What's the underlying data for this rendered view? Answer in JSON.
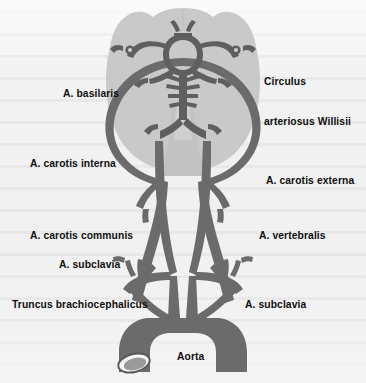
{
  "figure": {
    "colors": {
      "background": "#f2f2f2",
      "brain_fill": "#c9c9c9",
      "brainstem_fill": "#bdbdbd",
      "artery_fill": "#6b6b6b",
      "artery_dark": "#5f5f5f",
      "lumen_fill": "#f7f7f4",
      "label_text": "#0f0f0f"
    },
    "labels": [
      {
        "id": "circulus-arteriosus-willisii",
        "text": "Circulus\narteriosus Willisii",
        "line1": "Circulus",
        "line2": "arteriosus Willisii",
        "x": 264,
        "y": 49,
        "side": "right"
      },
      {
        "id": "a-basilaris",
        "text": "A. basilaris",
        "x": 63,
        "y": 87,
        "side": "left"
      },
      {
        "id": "a-carotis-interna",
        "text": "A. carotis interna",
        "x": 30,
        "y": 157,
        "side": "left"
      },
      {
        "id": "a-carotis-externa",
        "text": "A. carotis externa",
        "x": 266,
        "y": 174,
        "side": "right"
      },
      {
        "id": "a-carotis-communis",
        "text": "A. carotis communis",
        "x": 30,
        "y": 229,
        "side": "left"
      },
      {
        "id": "a-vertebralis",
        "text": "A. vertebralis",
        "x": 259,
        "y": 229,
        "side": "right"
      },
      {
        "id": "a-subclavia-left",
        "text": "A. subclavia",
        "x": 59,
        "y": 258,
        "side": "left"
      },
      {
        "id": "truncus-brachiocephalicus",
        "text": "Truncus brachiocephalicus",
        "x": 12,
        "y": 298,
        "side": "left"
      },
      {
        "id": "a-subclavia-right",
        "text": "A. subclavia",
        "x": 245,
        "y": 298,
        "side": "right"
      },
      {
        "id": "aorta",
        "text": "Aorta",
        "x": 177,
        "y": 350,
        "side": "center"
      }
    ]
  }
}
